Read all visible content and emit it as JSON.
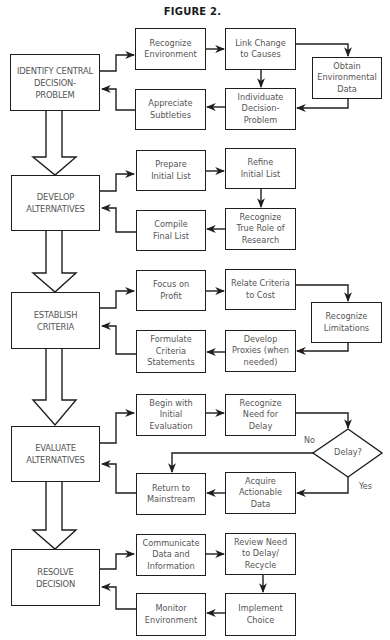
{
  "figure": {
    "title": "FIGURE 2."
  },
  "colors": {
    "line": "#1e1e1e",
    "text": "#555555",
    "background": "#ffffff"
  },
  "stages": [
    {
      "id": "identify",
      "label": "IDENTIFY CENTRAL DECISION-PROBLEM",
      "steps": [
        "Recognize Environment",
        "Link Change to Causes",
        "Obtain Environmental Data",
        "Individuate Decision-Problem",
        "Appreciate Subtleties"
      ]
    },
    {
      "id": "develop",
      "label": "DEVELOP ALTERNATIVES",
      "steps": [
        "Prepare Initial List",
        "Refine Initial List",
        "Recognize True Role of Research",
        "Compile Final List"
      ]
    },
    {
      "id": "establish",
      "label": "ESTABLISH CRITERIA",
      "steps": [
        "Focus on Profit",
        "Relate Criteria to Cost",
        "Recognize Limitations",
        "Develop Proxies (when needed)",
        "Formulate Criteria Statements"
      ]
    },
    {
      "id": "evaluate",
      "label": "EVALUATE ALTERNATIVES",
      "steps": [
        "Begin with Initial Evaluation",
        "Recognize Need for Delay",
        "Delay?",
        "Acquire Actionable Data",
        "Return to Mainstream"
      ]
    },
    {
      "id": "resolve",
      "label": "RESOLVE DECISION",
      "steps": [
        "Communicate Data and Information",
        "Review Need to Delay/ Recycle",
        "Implement Choice",
        "Monitor Environment"
      ]
    }
  ],
  "nodes": {
    "m1": [
      "IDENTIFY CENTRAL",
      "DECISION-",
      "PROBLEM"
    ],
    "a1": [
      "Recognize",
      "Environment"
    ],
    "a2": [
      "Link Change",
      "to Causes"
    ],
    "a3": [
      "Obtain",
      "Environmental",
      "Data"
    ],
    "a4": [
      "Individuate",
      "Decision-",
      "Problem"
    ],
    "a5": [
      "Appreciate",
      "Subtleties"
    ],
    "m2": [
      "DEVELOP",
      "ALTERNATIVES"
    ],
    "b1": [
      "Prepare",
      "Initial List"
    ],
    "b2": [
      "Refine",
      "Initial List"
    ],
    "b3": [
      "Recognize",
      "True Role of",
      "Research"
    ],
    "b4": [
      "Compile",
      "Final List"
    ],
    "m3": [
      "ESTABLISH",
      "CRITERIA"
    ],
    "c1": [
      "Focus on",
      "Profit"
    ],
    "c2": [
      "Relate Criteria",
      "to Cost"
    ],
    "c3": [
      "Recognize",
      "Limitations"
    ],
    "c4": [
      "Develop",
      "Proxies (when",
      "needed)"
    ],
    "c5": [
      "Formulate",
      "Criteria",
      "Statements"
    ],
    "m4": [
      "EVALUATE",
      "ALTERNATIVES"
    ],
    "d1": [
      "Begin with",
      "Initial",
      "Evaluation"
    ],
    "d2": [
      "Recognize",
      "Need for",
      "Delay"
    ],
    "d3": [
      "Delay?"
    ],
    "d4": [
      "Acquire",
      "Actionable",
      "Data"
    ],
    "d5": [
      "Return to",
      "Mainstream"
    ],
    "m5": [
      "RESOLVE",
      "DECISION"
    ],
    "e1": [
      "Communicate",
      "Data and",
      "Information"
    ],
    "e2": [
      "Review Need",
      "to Delay/",
      "Recycle"
    ],
    "e3": [
      "Implement",
      "Choice"
    ],
    "e4": [
      "Monitor",
      "Environment"
    ]
  },
  "decision_labels": {
    "no": "No",
    "yes": "Yes"
  }
}
